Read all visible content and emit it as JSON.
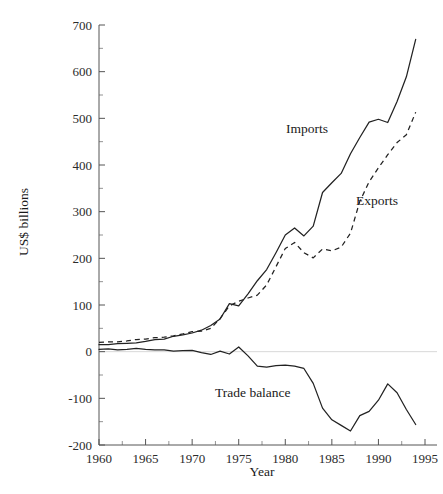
{
  "chart_data": {
    "type": "line",
    "title": "",
    "xlabel": "Year",
    "ylabel": "US$ billions",
    "xlim": [
      1960,
      1995
    ],
    "ylim": [
      -200,
      700
    ],
    "grid": false,
    "legend_position": "inline-annotations",
    "xticks": [
      1960,
      1965,
      1970,
      1975,
      1980,
      1985,
      1990,
      1995
    ],
    "xtick_labels": [
      "1960",
      "1965",
      "1970",
      "1975",
      "1980",
      "1985",
      "1990",
      "1995"
    ],
    "xminor_ticks": [
      1962.5,
      1967.5,
      1972.5,
      1977.5,
      1982.5,
      1987.5,
      1992.5
    ],
    "yticks": [
      -200,
      -100,
      0,
      100,
      200,
      300,
      400,
      500,
      600,
      700
    ],
    "ytick_labels": [
      "-200",
      "-100",
      "0",
      "100",
      "200",
      "300",
      "400",
      "500",
      "600",
      "700"
    ],
    "yminor_ticks": [
      -150,
      -50,
      50,
      150,
      250,
      350,
      450,
      550,
      650
    ],
    "zero_reference_line": 0,
    "x": [
      1960,
      1961,
      1962,
      1963,
      1964,
      1965,
      1966,
      1967,
      1968,
      1969,
      1970,
      1971,
      1972,
      1973,
      1974,
      1975,
      1976,
      1977,
      1978,
      1979,
      1980,
      1981,
      1982,
      1983,
      1984,
      1985,
      1986,
      1987,
      1988,
      1989,
      1990,
      1991,
      1992,
      1993,
      1994
    ],
    "series": [
      {
        "name": "Imports",
        "style": "solid",
        "values": [
          15,
          15,
          17,
          18,
          19,
          22,
          26,
          27,
          33,
          36,
          40,
          46,
          56,
          70,
          103,
          98,
          124,
          152,
          176,
          212,
          250,
          265,
          248,
          269,
          341,
          362,
          382,
          424,
          459,
          492,
          498,
          491,
          536,
          589,
          669
        ]
      },
      {
        "name": "Exports",
        "style": "dashed",
        "values": [
          20,
          21,
          21,
          23,
          26,
          27,
          30,
          31,
          34,
          38,
          43,
          44,
          50,
          71,
          98,
          108,
          115,
          121,
          143,
          182,
          221,
          234,
          212,
          201,
          220,
          216,
          224,
          254,
          322,
          364,
          394,
          422,
          448,
          465,
          513
        ]
      },
      {
        "name": "Trade balance",
        "style": "solid",
        "values": [
          5,
          6,
          4,
          5,
          7,
          5,
          4,
          4,
          1,
          2,
          3,
          -2,
          -6,
          1,
          -5,
          10,
          -9,
          -31,
          -33,
          -30,
          -29,
          -31,
          -36,
          -68,
          -121,
          -146,
          -158,
          -170,
          -137,
          -128,
          -104,
          -69,
          -88,
          -124,
          -156
        ]
      }
    ],
    "annotations": [
      {
        "text": "Imports",
        "x_px": 286,
        "y_px": 133
      },
      {
        "text": "Exports",
        "x_px": 356,
        "y_px": 205
      },
      {
        "text": "Trade balance",
        "x_px": 215,
        "y_px": 397
      }
    ]
  },
  "axes": {
    "y_axis_title": "US$ billions",
    "x_axis_title": "Year"
  }
}
